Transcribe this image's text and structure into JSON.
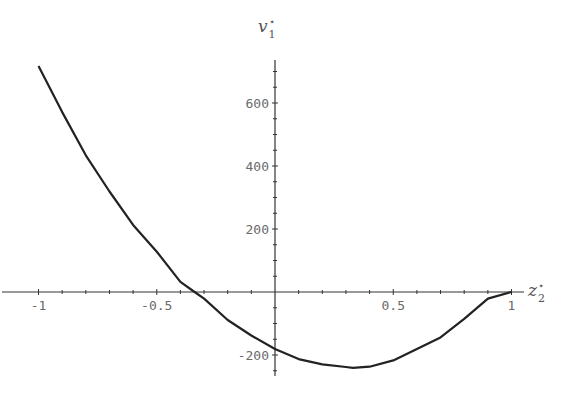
{
  "chart_data": {
    "type": "line",
    "title": "",
    "xlabel": "z2*",
    "ylabel": "v1*",
    "xlabel_parts": {
      "base": "z",
      "sub": "2",
      "sup": "⋆"
    },
    "ylabel_parts": {
      "base": "v",
      "sub": "1",
      "sup": "⋆"
    },
    "xlim": [
      -1,
      1
    ],
    "ylim": [
      -260,
      740
    ],
    "x_ticks": [
      -1,
      -0.5,
      0.5,
      1
    ],
    "x_tick_labels": [
      "-1",
      "-0.5",
      "0.5",
      "1"
    ],
    "y_ticks": [
      -200,
      200,
      400,
      600
    ],
    "y_tick_labels": [
      "-200",
      "200",
      "400",
      "600"
    ],
    "x_minor_step": 0.1,
    "y_minor_step": 50,
    "grid": false,
    "legend": null,
    "series": [
      {
        "name": "v1*(z2*)",
        "color": "#222222",
        "x": [
          -1.0,
          -0.9,
          -0.8,
          -0.7,
          -0.6,
          -0.5,
          -0.4,
          -0.34,
          -0.3,
          -0.2,
          -0.1,
          0.0,
          0.1,
          0.2,
          0.3,
          0.33,
          0.4,
          0.5,
          0.6,
          0.7,
          0.8,
          0.9,
          1.0
        ],
        "y": [
          717,
          571,
          434,
          319,
          213,
          128,
          32,
          0,
          -21,
          -89,
          -138,
          -181,
          -213,
          -230,
          -238,
          -241,
          -237,
          -217,
          -181,
          -144,
          -85,
          -21,
          0
        ]
      }
    ]
  }
}
